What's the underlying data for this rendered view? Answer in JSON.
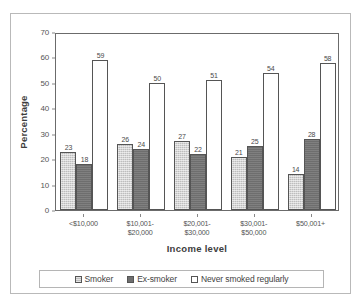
{
  "chart_data": {
    "type": "bar",
    "title": "",
    "xlabel": "Income level",
    "ylabel": "Percentage",
    "ylim": [
      0,
      70
    ],
    "yticks": [
      0,
      10,
      20,
      30,
      40,
      50,
      60,
      70
    ],
    "ytick_labels": [
      "0",
      "10",
      "20",
      "30",
      "40",
      "50",
      "60",
      "70"
    ],
    "grid": false,
    "legend_position": "bottom",
    "categories": [
      "<$10,000",
      "$10,001-\n$20,000",
      "$20,001-\n$30,000",
      "$30,001-\n$50,000",
      "$50,001+"
    ],
    "category_lines": [
      [
        "<$10,000"
      ],
      [
        "$10,001-",
        "$20,000"
      ],
      [
        "$20,001-",
        "$30,000"
      ],
      [
        "$30,001-",
        "$50,000"
      ],
      [
        "$50,001+"
      ]
    ],
    "series": [
      {
        "name": "Smoker",
        "color": "#bdbdbd",
        "values": [
          23,
          26,
          27,
          21,
          14
        ]
      },
      {
        "name": "Ex-smoker",
        "color": "#6e6e6e",
        "values": [
          18,
          24,
          22,
          25,
          28
        ]
      },
      {
        "name": "Never smoked regularly",
        "color": "#ffffff",
        "values": [
          59,
          50,
          51,
          54,
          58
        ]
      }
    ]
  },
  "axes": {
    "y_title": "Percentage",
    "x_title": "Income level"
  },
  "legend": {
    "items": [
      {
        "label": "Smoker",
        "swatch": "smoker"
      },
      {
        "label": "Ex-smoker",
        "swatch": "exsmoker"
      },
      {
        "label": "Never smoked regularly",
        "swatch": "never"
      }
    ]
  },
  "colors": {
    "smoker": "#bdbdbd",
    "exsmoker": "#6e6e6e",
    "never": "#ffffff",
    "axis": "#6b6b6b",
    "text": "#4a4a4a",
    "frame": "#b9b9b9"
  }
}
